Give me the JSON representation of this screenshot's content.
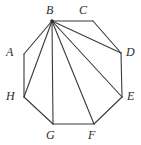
{
  "figure": {
    "kind": "geometry-diagram",
    "shape": "regular-octagon-with-diagonals-from-B",
    "width": 141,
    "height": 145,
    "background_color": "#ffffff",
    "stroke_color": "#3a3a3a",
    "label_color": "#2b2b2b",
    "stroke_width": 1.1,
    "vertex_dot": {
      "at": "B",
      "color": "#2b2b2b",
      "radius": 1.8
    },
    "vertices": [
      {
        "id": "A",
        "label": "A",
        "x": 24,
        "y": 54,
        "label_x": 6,
        "label_y": 46
      },
      {
        "id": "B",
        "label": "B",
        "x": 52,
        "y": 21,
        "label_x": 46,
        "label_y": 4
      },
      {
        "id": "C",
        "label": "C",
        "x": 93,
        "y": 21,
        "label_x": 79,
        "label_y": 4
      },
      {
        "id": "D",
        "label": "D",
        "x": 121,
        "y": 53,
        "label_x": 126,
        "label_y": 46
      },
      {
        "id": "E",
        "label": "E",
        "x": 122,
        "y": 97,
        "label_x": 127,
        "label_y": 90
      },
      {
        "id": "F",
        "label": "F",
        "x": 94,
        "y": 124,
        "label_x": 88,
        "label_y": 129
      },
      {
        "id": "G",
        "label": "G",
        "x": 53,
        "y": 124,
        "label_x": 46,
        "label_y": 129
      },
      {
        "id": "H",
        "label": "H",
        "x": 24,
        "y": 97,
        "label_x": 6,
        "label_y": 90
      }
    ],
    "perimeter_edges": [
      {
        "from": "A",
        "to": "B"
      },
      {
        "from": "B",
        "to": "C"
      },
      {
        "from": "C",
        "to": "D"
      },
      {
        "from": "D",
        "to": "E"
      },
      {
        "from": "E",
        "to": "F"
      },
      {
        "from": "F",
        "to": "G"
      },
      {
        "from": "G",
        "to": "H"
      },
      {
        "from": "H",
        "to": "A"
      }
    ],
    "diagonals": [
      {
        "from": "B",
        "to": "D"
      },
      {
        "from": "B",
        "to": "E"
      },
      {
        "from": "B",
        "to": "F"
      },
      {
        "from": "B",
        "to": "G"
      },
      {
        "from": "B",
        "to": "H"
      }
    ]
  }
}
